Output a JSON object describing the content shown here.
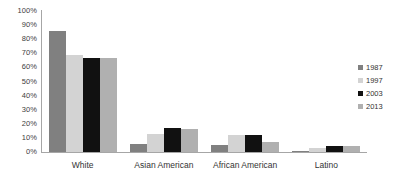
{
  "chart_data": {
    "type": "bar",
    "title": "",
    "xlabel": "",
    "ylabel": "",
    "ylim": [
      0,
      100
    ],
    "grid": false,
    "legend_position": "right",
    "categories": [
      "White",
      "Asian American",
      "African American",
      "Latino"
    ],
    "ytick_labels": [
      "100%",
      "90%",
      "80%",
      "70%",
      "60%",
      "50%",
      "40%",
      "30%",
      "20%",
      "10%",
      "0%"
    ],
    "ytick_values": [
      100,
      90,
      80,
      70,
      60,
      50,
      40,
      30,
      20,
      10,
      0
    ],
    "series": [
      {
        "name": "1987",
        "color": "#808080",
        "values": [
          86,
          6,
          5,
          1
        ]
      },
      {
        "name": "1997",
        "color": "#d3d3d3",
        "values": [
          69,
          13,
          12,
          3
        ]
      },
      {
        "name": "2003",
        "color": "#111111",
        "values": [
          67,
          17,
          12,
          4
        ]
      },
      {
        "name": "2013",
        "color": "#b0b0b0",
        "values": [
          67,
          16,
          7,
          4
        ]
      }
    ]
  },
  "axis": {
    "line_color": "#a6a6a6"
  }
}
